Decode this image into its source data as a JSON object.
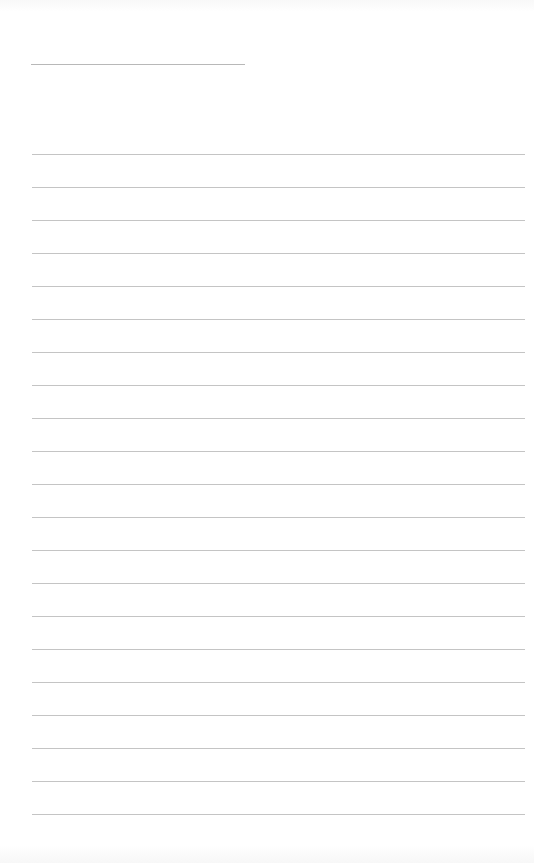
{
  "page": {
    "type": "lined-paper",
    "title_line": {
      "present": true
    },
    "ruled_lines": {
      "count": 21,
      "first_y": 154,
      "spacing": 33,
      "color": "#c4c4c4"
    }
  }
}
